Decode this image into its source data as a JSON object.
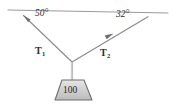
{
  "figure": {
    "angles": [
      {
        "id": "left",
        "label": "50°",
        "value": 50,
        "unit": "degrees",
        "measured_from": "ceiling"
      },
      {
        "id": "right",
        "label": "32°",
        "value": 32,
        "unit": "degrees",
        "measured_from": "ceiling"
      }
    ],
    "forces": [
      {
        "id": "T1",
        "symbol": "T",
        "subscript": "1",
        "direction": "up-left"
      },
      {
        "id": "T2",
        "symbol": "T",
        "subscript": "2",
        "direction": "up-right"
      }
    ],
    "weight": {
      "label": "100",
      "value": 100,
      "shape": "trapezoid"
    },
    "colors": {
      "line": "#8a8a8a",
      "ceiling": "#9a9a9a",
      "cord": "#b0b0b0",
      "weight_fill_top": "#e2e2e2",
      "weight_fill_bottom": "#bdbdbd",
      "weight_stroke": "#6f6f6f",
      "text": "#2b2b2b",
      "background": "#ffffff"
    },
    "geometry": {
      "ceiling": {
        "x1": 8,
        "y1": 10,
        "x2": 168,
        "y2": 13
      },
      "junction": {
        "x": 72,
        "y": 62
      },
      "cable_left_anchor": {
        "x": 23,
        "y": 15
      },
      "cable_right_anchor": {
        "x": 148,
        "y": 17
      },
      "cord": {
        "x1": 72,
        "y1": 62,
        "x2": 72,
        "y2": 80
      },
      "weight_top": {
        "x1": 62,
        "x2": 84,
        "y": 80
      },
      "weight_bottom": {
        "x1": 55,
        "x2": 92,
        "y": 100
      }
    }
  }
}
